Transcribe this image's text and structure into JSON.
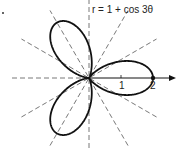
{
  "figure": {
    "marker": ".",
    "equation": "r = 1 + cos 3θ",
    "tick_labels": [
      "1",
      "2"
    ]
  },
  "chart_data": {
    "type": "polar",
    "title": "r = 1 + cos 3θ",
    "function": "1 + cos(3*theta)",
    "theta_range": [
      0,
      6.2832
    ],
    "r_axis_ticks": [
      1,
      2
    ],
    "r_max": 2,
    "petals": 3,
    "petal_directions_deg": [
      0,
      120,
      240
    ],
    "guide_lines_deg": [
      0,
      30,
      60,
      90,
      120,
      150
    ],
    "highlighted_point": {
      "r": 2,
      "theta_deg": 0
    },
    "colors": {
      "curve": "#111111",
      "guides": "#555555",
      "axis": "#111111"
    }
  }
}
